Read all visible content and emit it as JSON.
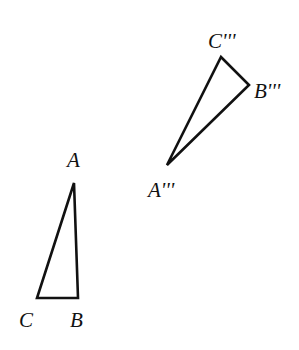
{
  "diagram": {
    "stroke_color": "#111111",
    "background": "#ffffff",
    "triangles": [
      {
        "name": "ABC",
        "vertices": {
          "A": [
            74,
            183
          ],
          "B": [
            78,
            298
          ],
          "C": [
            37,
            298
          ]
        },
        "labels": {
          "A": {
            "text": "A",
            "x": 67,
            "y": 167
          },
          "B": {
            "text": "B",
            "x": 70,
            "y": 327
          },
          "C": {
            "text": "C",
            "x": 19,
            "y": 327
          }
        }
      },
      {
        "name": "A'''B'''C'''",
        "vertices": {
          "A": [
            167,
            165
          ],
          "B": [
            249,
            85
          ],
          "C": [
            221,
            57
          ]
        },
        "labels": {
          "A": {
            "text": "A'''",
            "x": 148,
            "y": 197
          },
          "B": {
            "text": "B'''",
            "x": 254,
            "y": 98
          },
          "C": {
            "text": "C'''",
            "x": 208,
            "y": 48
          }
        }
      }
    ]
  }
}
